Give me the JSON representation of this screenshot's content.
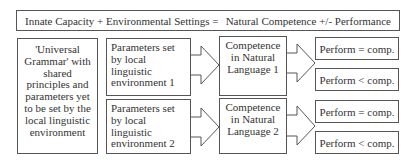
{
  "header": {
    "left": "Innate Capacity + Environmental Settings =",
    "right": "Natural Competence +/- Performance"
  },
  "universal_grammar": {
    "text": "'Universal Grammar' with shared principles and parameters yet to be set by the local linguistic environment"
  },
  "parameters": [
    {
      "text": "Parameters set by local linguistic environment 1"
    },
    {
      "text": "Parameters set by local linguistic environment 2"
    }
  ],
  "competence": [
    {
      "text": "Competence in Natural Language 1"
    },
    {
      "text": "Competence in Natural Language 2"
    }
  ],
  "performance": [
    {
      "text": "Perform = comp."
    },
    {
      "text": "Perform < comp."
    },
    {
      "text": "Perform = comp."
    },
    {
      "text": "Perform < comp."
    }
  ],
  "colors": {
    "stroke": "#555555",
    "text": "#333333",
    "background": "#ffffff"
  }
}
